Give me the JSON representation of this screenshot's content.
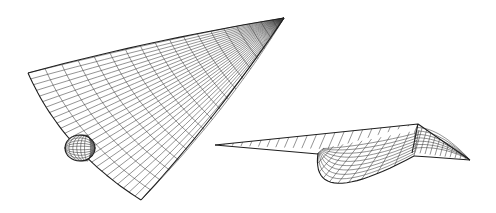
{
  "figure": {
    "background_color": "#ffffff",
    "line_color": "#333333",
    "views": [
      {
        "name": "oblique-top-view",
        "nose_tip": [
          284,
          18
        ],
        "wing_tip": [
          28,
          73
        ],
        "aft_tip": [
          141,
          200
        ],
        "canopy_center": [
          80,
          148
        ],
        "u_lines": 26,
        "v_lines": 18
      },
      {
        "name": "side-rear-view",
        "left_tip": [
          215,
          145
        ],
        "ridge_corner": [
          418,
          124
        ],
        "right_tip": [
          470,
          160
        ],
        "pod_bottom": [
          330,
          190
        ],
        "u_lines": 22,
        "v_lines": 10
      }
    ]
  }
}
